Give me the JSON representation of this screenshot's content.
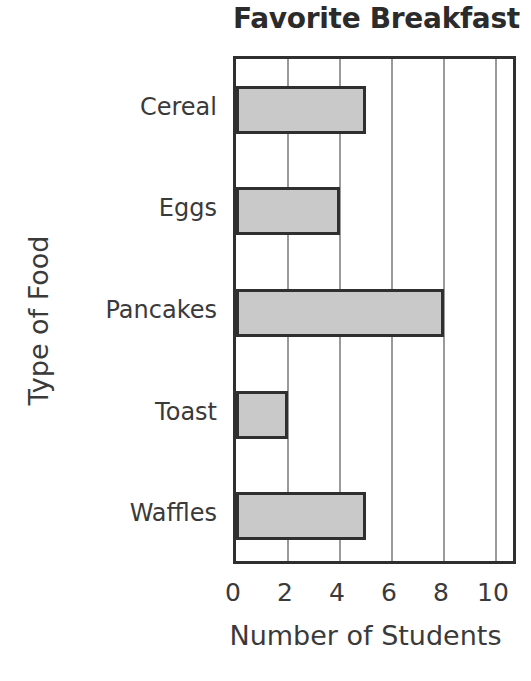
{
  "chart_data": {
    "type": "bar",
    "orientation": "horizontal",
    "title": "Favorite Breakfast",
    "xlabel": "Number of Students",
    "ylabel": "Type of Food",
    "categories": [
      "Cereal",
      "Eggs",
      "Pancakes",
      "Toast",
      "Waffles"
    ],
    "values": [
      5,
      4,
      8,
      2,
      5
    ],
    "xticks": [
      "0",
      "2",
      "4",
      "6",
      "8",
      "10"
    ],
    "xtick_values": [
      0,
      2,
      4,
      6,
      8,
      10
    ],
    "xlim": [
      0,
      10.9
    ],
    "grid": "vertical",
    "legend": "none",
    "bar_fill_color": "#c9c9c9",
    "bar_border_color": "#2f2f2f",
    "gridline_color": "#9a9a9a",
    "axis_color": "#2f2f2f",
    "text_color": "#3a3a3a",
    "background_color": "#ffffff"
  }
}
